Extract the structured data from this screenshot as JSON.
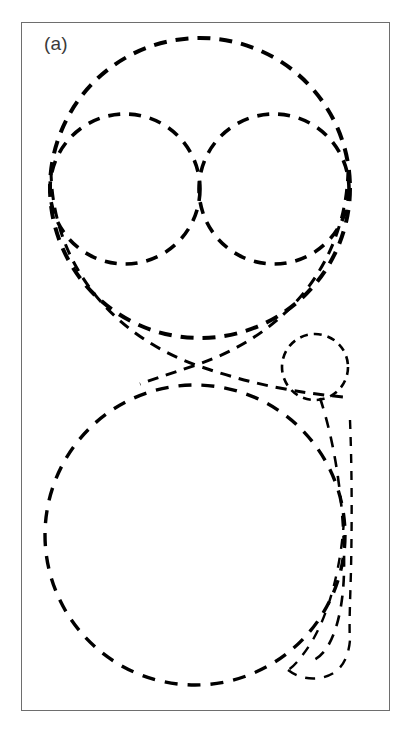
{
  "figure": {
    "panel_label": "(a)",
    "caption_label_position": "top-left",
    "background_color": "#ffffff",
    "stroke_color": "#000000",
    "frame": {
      "x": 21,
      "y": 22,
      "width": 369,
      "height": 689,
      "border_color": "#6e6e6e",
      "border_width": 1.4
    }
  },
  "chart_data": {
    "type": "diagram",
    "subtype": "tangent-circle-packing",
    "title": "(a)",
    "xlabel": "",
    "ylabel": "",
    "grid": false,
    "legend": false,
    "units": "pixels",
    "xlim": [
      21,
      390
    ],
    "ylim": [
      22,
      711
    ],
    "line_style": "dashed",
    "dash_pattern": "10 7",
    "shapes": [
      {
        "name": "outer-top-circle",
        "kind": "circle",
        "cx": 200,
        "cy": 188,
        "r": 150,
        "stroke_width": 4.0,
        "dash": "13 9"
      },
      {
        "name": "inner-top-left-circle",
        "kind": "circle",
        "cx": 125,
        "cy": 189,
        "r": 75,
        "stroke_width": 3.6,
        "dash": "12 9"
      },
      {
        "name": "inner-top-right-circle",
        "kind": "circle",
        "cx": 274,
        "cy": 189,
        "r": 75,
        "stroke_width": 3.6,
        "dash": "12 9"
      },
      {
        "name": "small-right-circle",
        "kind": "circle",
        "cx": 315,
        "cy": 367,
        "r": 33,
        "stroke_width": 2.6,
        "dash": "8 6"
      },
      {
        "name": "outer-bottom-circle",
        "kind": "circle",
        "cx": 195,
        "cy": 535,
        "r": 150,
        "stroke_width": 3.4,
        "dash": "13 10"
      },
      {
        "name": "right-teardrop-outer-arc",
        "kind": "arc",
        "stroke_width": 2.6,
        "dash": "11 9"
      },
      {
        "name": "right-teardrop-inner-arc",
        "kind": "arc",
        "stroke_width": 2.4,
        "dash": "10 9"
      },
      {
        "name": "right-vertical-arc",
        "kind": "arc",
        "stroke_width": 2.4,
        "dash": "9 8"
      },
      {
        "name": "upper-crossing-arc-left",
        "kind": "arc",
        "stroke_width": 3.0,
        "dash": "11 8"
      },
      {
        "name": "upper-crossing-arc-right",
        "kind": "arc",
        "stroke_width": 3.0,
        "dash": "11 8"
      }
    ],
    "tangency_points": [
      {
        "name": "top-inner-circles-tangency",
        "x": 200,
        "y": 189
      },
      {
        "name": "upper-lower-crossing",
        "x": 196,
        "y": 365
      },
      {
        "name": "lower-right-crossing",
        "x": 311,
        "y": 660
      }
    ],
    "annotations": [
      {
        "text": "(a)",
        "x": 44,
        "y": 33,
        "role": "panel-label"
      }
    ]
  }
}
